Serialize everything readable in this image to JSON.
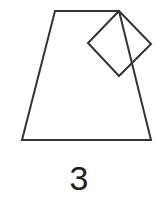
{
  "figure": {
    "stroke_color": "#333333",
    "stroke_width": 2,
    "trapezoid": {
      "points": "55,11 119,11 151,140 22,140"
    },
    "square": {
      "points": "119,11 151,44 119,76 88,43"
    }
  },
  "caption": {
    "label": "3"
  }
}
